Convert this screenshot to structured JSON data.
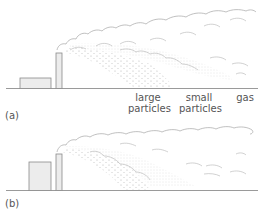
{
  "figure": {
    "panels": [
      {
        "id": "a",
        "tag": "(a)",
        "labels": {
          "large_particles_1": "large",
          "large_particles_2": "particles",
          "small_particles_1": "small",
          "small_particles_2": "particles",
          "gas": "gas"
        }
      },
      {
        "id": "b",
        "tag": "(b)"
      }
    ],
    "colors": {
      "line": "#9a9a9a",
      "fill": "#ececec",
      "dots": "#b5b5b5",
      "text": "#555555"
    }
  }
}
